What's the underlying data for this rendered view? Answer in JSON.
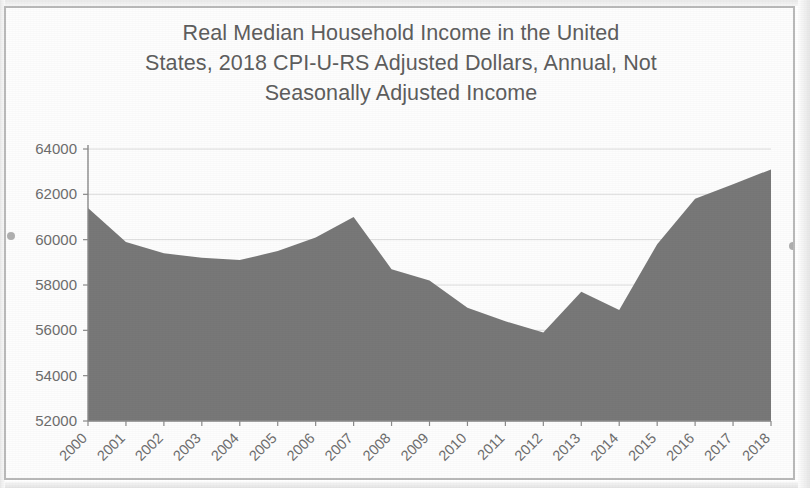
{
  "chart_data": {
    "type": "area",
    "title": "Real Median Household Income in the United States, 2018 CPI-U-RS Adjusted Dollars, Annual, Not Seasonally Adjusted Income",
    "title_lines": [
      "Real Median Household Income in the United",
      "States, 2018 CPI-U-RS Adjusted Dollars, Annual, Not",
      "Seasonally Adjusted Income"
    ],
    "xlabel": "",
    "ylabel": "",
    "categories": [
      "2000",
      "2001",
      "2002",
      "2003",
      "2004",
      "2005",
      "2006",
      "2007",
      "2008",
      "2009",
      "2010",
      "2011",
      "2012",
      "2013",
      "2014",
      "2015",
      "2016",
      "2017",
      "2018"
    ],
    "values": [
      61400,
      59900,
      59400,
      59200,
      59100,
      59500,
      60100,
      61000,
      58700,
      58200,
      57000,
      56400,
      55900,
      57700,
      56900,
      59800,
      61800,
      62450,
      63100
    ],
    "ylim": [
      52000,
      64000
    ],
    "ytick_labels": [
      "52000",
      "54000",
      "56000",
      "58000",
      "60000",
      "62000",
      "64000"
    ],
    "ytick_values": [
      52000,
      54000,
      56000,
      58000,
      60000,
      62000,
      64000
    ],
    "grid": true,
    "grid_axis": "y",
    "legend": false,
    "legend_position": "none",
    "series_color": "#787878",
    "axis_color": "#8a8a8a",
    "grid_color": "#dcdcdc",
    "text_color": "#6d6d6d",
    "xtick_rotation": 45
  }
}
